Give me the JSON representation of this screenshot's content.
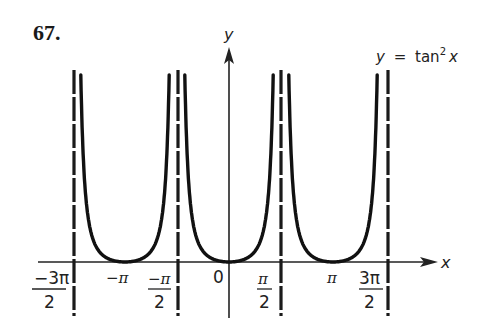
{
  "problem_number": "67.",
  "equation": {
    "lhs": "y",
    "eq": "=",
    "fn": "tan",
    "exp": "2",
    "arg": "x"
  },
  "axes": {
    "x_label": "x",
    "y_label": "y"
  },
  "ticks": {
    "neg_3pi_2": {
      "num": "−3π",
      "den": "2"
    },
    "neg_pi": "−π",
    "neg_pi_2": {
      "num": "−π",
      "den": "2"
    },
    "zero": "0",
    "pi_2": {
      "num": "π",
      "den": "2"
    },
    "pi": "π",
    "three_pi_2": {
      "num": "3π",
      "den": "2"
    }
  },
  "chart_data": {
    "type": "line",
    "xlabel": "x",
    "ylabel": "y",
    "function": "tan^2(x)",
    "x_ticks": [
      "-3π/2",
      "-π",
      "-π/2",
      "0",
      "π/2",
      "π",
      "3π/2"
    ],
    "x_tick_values": [
      -4.712,
      -3.1416,
      -1.5708,
      0,
      1.5708,
      3.1416,
      4.712
    ],
    "vertical_asymptotes": [
      "-3π/2",
      "-π/2",
      "π/2",
      "3π/2"
    ],
    "minima": [
      {
        "x": "-π",
        "y": 0
      },
      {
        "x": "0",
        "y": 0
      },
      {
        "x": "π",
        "y": 0
      }
    ],
    "xlim": [
      -5.3,
      6.3
    ],
    "ylim": [
      0,
      18
    ],
    "grid": false,
    "legend": "none",
    "series": [
      {
        "name": "tan^2 x branch 1",
        "x_range": [
          "-3π/2",
          "-π/2"
        ],
        "min_at": "-π"
      },
      {
        "name": "tan^2 x branch 2",
        "x_range": [
          "-π/2",
          "π/2"
        ],
        "min_at": "0"
      },
      {
        "name": "tan^2 x branch 3",
        "x_range": [
          "π/2",
          "3π/2"
        ],
        "min_at": "π"
      }
    ]
  }
}
